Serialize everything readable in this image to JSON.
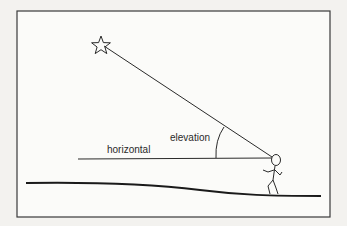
{
  "diagram": {
    "labels": {
      "horizontal": "horizontal",
      "elevation": "elevation"
    },
    "elements": {
      "object": "star",
      "observer": "stick-figure person",
      "ground": "ground line",
      "sight_line": "line of sight from observer to star",
      "horizontal_line": "horizontal reference line",
      "angle_arc": "elevation angle arc"
    },
    "colors": {
      "ink": "#2a2a2a",
      "paper": "#f3f2ef",
      "frame": "#3a3a3a"
    }
  }
}
